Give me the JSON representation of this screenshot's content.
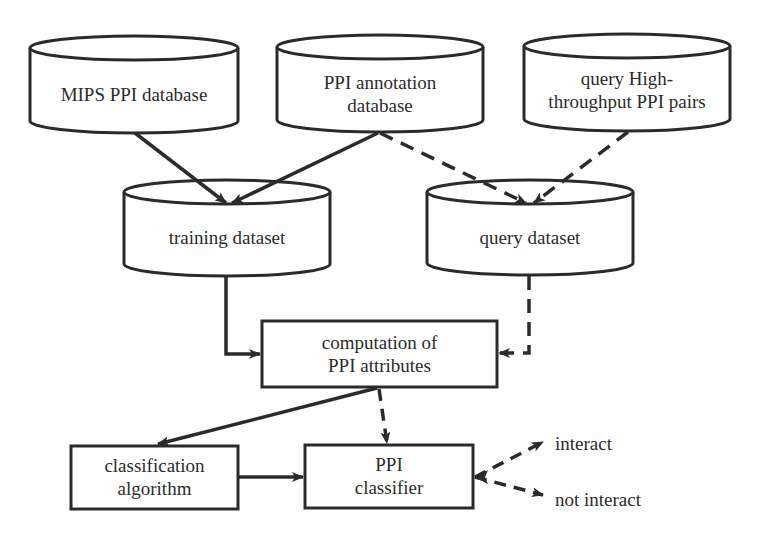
{
  "diagram": {
    "type": "flowchart",
    "stroke_color": "#2b2b2b",
    "background_color": "#ffffff",
    "nodes": {
      "mips_db": {
        "shape": "cylinder",
        "label_lines": [
          "MIPS PPI database"
        ]
      },
      "annotation_db": {
        "shape": "cylinder",
        "label_lines": [
          "PPI annotation",
          "database"
        ]
      },
      "highthroughput_db": {
        "shape": "cylinder",
        "label_lines": [
          "query High-",
          "throughput PPI pairs"
        ]
      },
      "training_dataset": {
        "shape": "cylinder",
        "label_lines": [
          "training dataset"
        ]
      },
      "query_dataset": {
        "shape": "cylinder",
        "label_lines": [
          "query dataset"
        ]
      },
      "computation": {
        "shape": "rectangle",
        "label_lines": [
          "computation of",
          "PPI attributes"
        ]
      },
      "classification_algorithm": {
        "shape": "rectangle",
        "label_lines": [
          "classification",
          "algorithm"
        ]
      },
      "ppi_classifier": {
        "shape": "rectangle",
        "label_lines": [
          "PPI",
          "classifier"
        ]
      },
      "out_interact": {
        "shape": "text",
        "label_lines": [
          "interact"
        ]
      },
      "out_not_interact": {
        "shape": "text",
        "label_lines": [
          "not interact"
        ]
      }
    },
    "edges": [
      {
        "from": "mips_db",
        "to": "training_dataset",
        "style": "solid"
      },
      {
        "from": "annotation_db",
        "to": "training_dataset",
        "style": "solid"
      },
      {
        "from": "annotation_db",
        "to": "query_dataset",
        "style": "dashed"
      },
      {
        "from": "highthroughput_db",
        "to": "query_dataset",
        "style": "dashed"
      },
      {
        "from": "training_dataset",
        "to": "computation",
        "style": "solid"
      },
      {
        "from": "query_dataset",
        "to": "computation",
        "style": "dashed"
      },
      {
        "from": "computation",
        "to": "classification_algorithm",
        "style": "solid"
      },
      {
        "from": "computation",
        "to": "ppi_classifier",
        "style": "dashed"
      },
      {
        "from": "classification_algorithm",
        "to": "ppi_classifier",
        "style": "solid"
      },
      {
        "from": "ppi_classifier",
        "to": "out_interact",
        "style": "dashed"
      },
      {
        "from": "ppi_classifier",
        "to": "out_not_interact",
        "style": "dashed"
      }
    ]
  }
}
